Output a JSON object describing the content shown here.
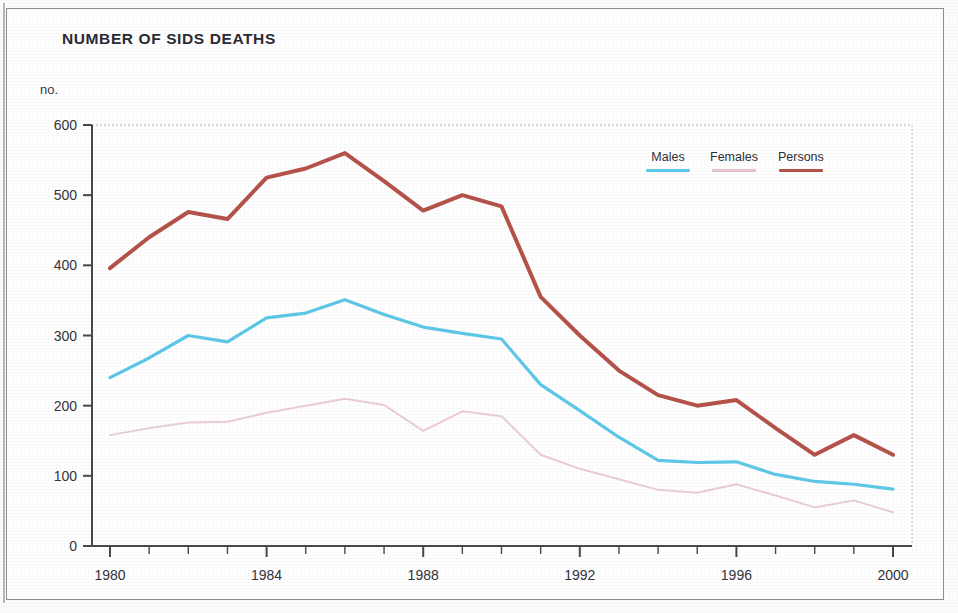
{
  "chart_data": {
    "type": "line",
    "title": "NUMBER OF SIDS DEATHS",
    "ylabel": "no.",
    "xlabel": "",
    "unit_label": "no.",
    "ylim": [
      0,
      600
    ],
    "y_ticks": [
      0,
      100,
      200,
      300,
      400,
      500,
      600
    ],
    "xlim": [
      1980,
      2000
    ],
    "x_ticks_labeled": [
      1980,
      1984,
      1988,
      1992,
      1996,
      2000
    ],
    "x": [
      1980,
      1981,
      1982,
      1983,
      1984,
      1985,
      1986,
      1987,
      1988,
      1989,
      1990,
      1991,
      1992,
      1993,
      1994,
      1995,
      1996,
      1997,
      1998,
      1999,
      2000
    ],
    "grid": false,
    "legend_position": "top-right",
    "series": [
      {
        "name": "Males",
        "color": "#5ec8e8",
        "values": [
          240,
          268,
          300,
          291,
          325,
          332,
          351,
          330,
          312,
          303,
          295,
          230,
          193,
          155,
          122,
          119,
          120,
          102,
          92,
          88,
          81
        ]
      },
      {
        "name": "Females",
        "color": "#e8c4cf",
        "values": [
          158,
          168,
          176,
          177,
          190,
          200,
          210,
          201,
          164,
          192,
          185,
          130,
          110,
          95,
          80,
          76,
          88,
          72,
          55,
          65,
          48
        ]
      },
      {
        "name": "Persons",
        "color": "#b5534a",
        "values": [
          396,
          440,
          476,
          466,
          525,
          538,
          560,
          520,
          478,
          500,
          484,
          355,
          300,
          250,
          215,
          200,
          208,
          168,
          130,
          158,
          130
        ]
      }
    ]
  },
  "legend": {
    "items": [
      {
        "label": "Males",
        "color": "#5ec8e8"
      },
      {
        "label": "Females",
        "color": "#e8c4cf"
      },
      {
        "label": "Persons",
        "color": "#b5534a"
      }
    ]
  }
}
